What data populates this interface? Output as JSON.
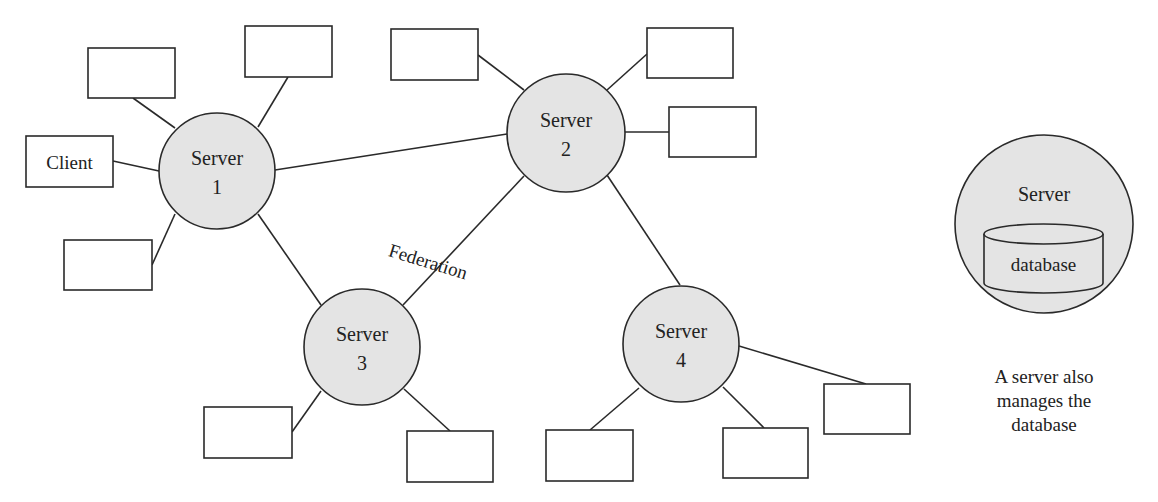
{
  "diagram": {
    "colors": {
      "stroke": "#2a2a2a",
      "server_fill": "#e4e4e4",
      "box_fill": "#ffffff",
      "text": "#222222"
    },
    "servers": [
      {
        "id": "s1",
        "line1": "Server",
        "line2": "1",
        "cx": 217,
        "cy": 171,
        "r": 58
      },
      {
        "id": "s2",
        "line1": "Server",
        "line2": "2",
        "cx": 566,
        "cy": 133,
        "r": 59
      },
      {
        "id": "s3",
        "line1": "Server",
        "line2": "3",
        "cx": 362,
        "cy": 347,
        "r": 58
      },
      {
        "id": "s4",
        "line1": "Server",
        "line2": "4",
        "cx": 681,
        "cy": 344,
        "r": 58
      }
    ],
    "client_label": "Client",
    "federation_label": "Federation",
    "legend": {
      "server_label": "Server",
      "database_label": "database",
      "caption_lines": [
        "A server also",
        "manages the",
        "database"
      ]
    }
  }
}
